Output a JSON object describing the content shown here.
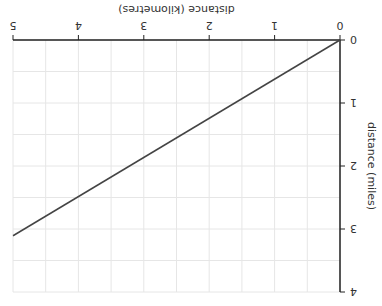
{
  "chart_data": {
    "type": "line",
    "title": "",
    "xlabel": "distance (kilometres)",
    "ylabel": "distance (miles)",
    "x_ticks": [
      "0",
      "1",
      "2",
      "3",
      "4",
      "5"
    ],
    "y_ticks": [
      "0",
      "1",
      "2",
      "3",
      "4"
    ],
    "xlim": [
      0,
      5
    ],
    "ylim": [
      0,
      4
    ],
    "grid": true,
    "orientation": "rotated 180 degrees",
    "series": [
      {
        "name": "km to miles",
        "x": [
          0,
          5
        ],
        "y": [
          0,
          3.107
        ],
        "color": "#444444"
      }
    ]
  },
  "colors": {
    "axis": "#222222",
    "grid": "#e6e6e6",
    "line": "#444444",
    "text": "#333333"
  }
}
